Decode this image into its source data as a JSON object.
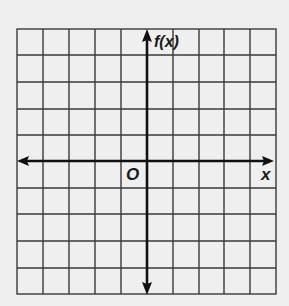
{
  "graph": {
    "y_axis_label": "f(x)",
    "x_axis_label": "x",
    "origin_label": "O",
    "grid": {
      "columns": 10,
      "rows": 10
    },
    "colors": {
      "background": "#efefef",
      "grid_line": "#3a3a3a",
      "axis": "#111111"
    }
  }
}
